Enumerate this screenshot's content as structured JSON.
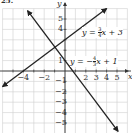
{
  "problem_label": "25.",
  "chart_data": {
    "type": "line",
    "title": "",
    "xlabel": "x",
    "ylabel": "y",
    "xlim": [
      -6,
      6
    ],
    "ylim": [
      -6,
      6
    ],
    "grid": true,
    "x_tick_labels": [
      "-4",
      "-2",
      "2",
      "3",
      "4",
      "5"
    ],
    "x_ticks": [
      -4,
      -2,
      2,
      3,
      4,
      5
    ],
    "y_tick_labels": [
      "5",
      "4",
      "1",
      "-1",
      "-2",
      "-3",
      "-4",
      "-5"
    ],
    "y_ticks": [
      5,
      4,
      1,
      -1,
      -2,
      -3,
      -4,
      -5
    ],
    "series": [
      {
        "name": "y = 3/4 x + 3",
        "slope": 0.75,
        "intercept": 3,
        "x": [
          -6,
          4
        ],
        "y": [
          -1.5,
          6
        ],
        "label_parts": {
          "prefix": "y = ",
          "num": "3",
          "den": "4",
          "suffix": "x + 3"
        },
        "color": "#222222"
      },
      {
        "name": "y = -4/3 x + 1",
        "slope": -1.3333,
        "intercept": 1,
        "x": [
          -3.6,
          5.1
        ],
        "y": [
          5.8,
          -5.8
        ],
        "label_parts": {
          "prefix": "y = −",
          "num": "4",
          "den": "3",
          "suffix": "x + 1"
        },
        "color": "#222222"
      }
    ],
    "intersection": {
      "x": -0.96,
      "y": 2.28
    }
  },
  "colors": {
    "grid": "#cfcfcf",
    "axis": "#333333",
    "line": "#222222"
  }
}
